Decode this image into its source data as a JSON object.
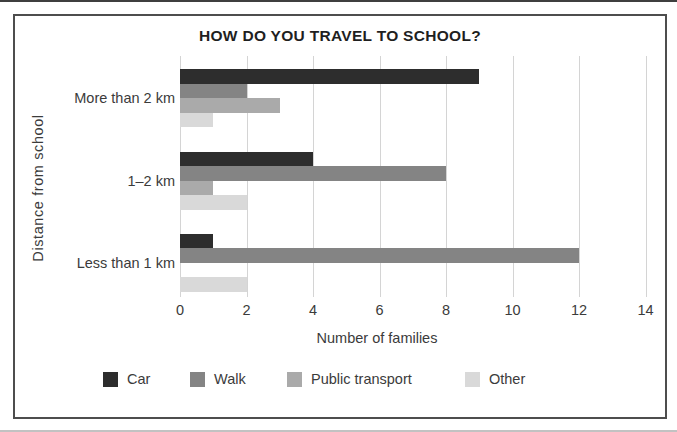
{
  "figure": {
    "background": "#ffffff",
    "frame_border_color": "#4d4d4d",
    "text_color": "#3b3b3b",
    "title_color": "#1f1f1f"
  },
  "chart_data": {
    "type": "bar",
    "orientation": "horizontal",
    "title": "HOW DO YOU TRAVEL TO SCHOOL?",
    "xlabel": "Number of families",
    "ylabel": "Distance from school",
    "categories": [
      "More than 2 km",
      "1–2 km",
      "Less than 1 km"
    ],
    "series": [
      {
        "name": "Car",
        "color": "#2d2d2d",
        "values": [
          9,
          4,
          1
        ]
      },
      {
        "name": "Walk",
        "color": "#848484",
        "values": [
          2,
          8,
          12
        ]
      },
      {
        "name": "Public transport",
        "color": "#aaaaaa",
        "values": [
          3,
          1,
          0
        ]
      },
      {
        "name": "Other",
        "color": "#d9d9d9",
        "values": [
          1,
          2,
          2
        ]
      }
    ],
    "x_ticks": [
      0,
      2,
      4,
      6,
      8,
      10,
      12,
      14
    ],
    "xlim": [
      0,
      14
    ],
    "grid": true,
    "gridline_color": "#d4d4d4",
    "legend_position": "bottom"
  }
}
